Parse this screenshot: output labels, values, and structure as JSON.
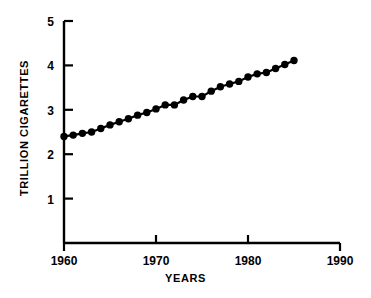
{
  "chart_data": {
    "type": "line",
    "title": "",
    "xlabel": "YEARS",
    "ylabel": "TRILLION CIGARETTES",
    "xlim": [
      1960,
      1990
    ],
    "ylim": [
      0,
      5
    ],
    "grid": false,
    "legend": null,
    "marker": "filled-circle",
    "line_color": "#000000",
    "marker_color": "#000000",
    "background_color": "#ffffff",
    "xticks": [
      1960,
      1970,
      1980,
      1990
    ],
    "xtick_labels": [
      "1960",
      "1970",
      "1980",
      "1990"
    ],
    "yticks": [
      1,
      2,
      3,
      4,
      5
    ],
    "ytick_labels": [
      "1",
      "2",
      "3",
      "4",
      "5"
    ],
    "x": [
      1960,
      1961,
      1962,
      1963,
      1964,
      1965,
      1966,
      1967,
      1968,
      1969,
      1970,
      1971,
      1972,
      1973,
      1974,
      1975,
      1976,
      1977,
      1978,
      1979,
      1980,
      1981,
      1982,
      1983,
      1984,
      1985
    ],
    "values": [
      2.4,
      2.42,
      2.46,
      2.5,
      2.58,
      2.65,
      2.72,
      2.8,
      2.88,
      2.93,
      3.0,
      3.1,
      3.1,
      3.2,
      3.28,
      3.28,
      3.4,
      3.5,
      3.56,
      3.62,
      3.72,
      3.78,
      3.8,
      3.88,
      3.95,
      4.0
    ],
    "values_full": [
      2.4,
      2.42,
      2.46,
      2.5,
      2.58,
      2.65,
      2.72,
      2.8,
      2.88,
      2.93,
      3.0,
      3.1,
      3.1,
      3.2,
      3.28,
      3.28,
      3.4,
      3.5,
      3.56,
      3.62,
      3.72,
      3.78,
      3.8,
      3.88,
      3.95,
      4.0
    ],
    "series": [
      {
        "name": "World cigarette consumption",
        "x": [
          1960,
          1961,
          1962,
          1963,
          1964,
          1965,
          1966,
          1967,
          1968,
          1969,
          1970,
          1971,
          1972,
          1973,
          1974,
          1975,
          1976,
          1977,
          1978,
          1979,
          1980,
          1981,
          1982,
          1983,
          1984,
          1985
        ],
        "y": [
          2.4,
          2.43,
          2.47,
          2.5,
          2.58,
          2.66,
          2.73,
          2.8,
          2.88,
          2.94,
          3.02,
          3.11,
          3.11,
          3.22,
          3.3,
          3.3,
          3.42,
          3.52,
          3.58,
          3.64,
          3.74,
          3.81,
          3.84,
          3.93,
          4.02,
          4.11
        ]
      }
    ],
    "points": [
      {
        "year": 1960,
        "value": 2.4
      },
      {
        "year": 1961,
        "value": 2.43
      },
      {
        "year": 1962,
        "value": 2.47
      },
      {
        "year": 1963,
        "value": 2.5
      },
      {
        "year": 1964,
        "value": 2.58
      },
      {
        "year": 1965,
        "value": 2.66
      },
      {
        "year": 1966,
        "value": 2.73
      },
      {
        "year": 1967,
        "value": 2.8
      },
      {
        "year": 1968,
        "value": 2.88
      },
      {
        "year": 1969,
        "value": 2.94
      },
      {
        "year": 1970,
        "value": 3.02
      },
      {
        "year": 1971,
        "value": 3.11
      },
      {
        "year": 1972,
        "value": 3.11
      },
      {
        "year": 1973,
        "value": 3.22
      },
      {
        "year": 1974,
        "value": 3.3
      },
      {
        "year": 1975,
        "value": 3.3
      },
      {
        "year": 1976,
        "value": 3.42
      },
      {
        "year": 1977,
        "value": 3.52
      },
      {
        "year": 1978,
        "value": 3.58
      },
      {
        "year": 1979,
        "value": 3.64
      },
      {
        "year": 1980,
        "value": 3.74
      },
      {
        "year": 1981,
        "value": 3.81
      },
      {
        "year": 1982,
        "value": 3.84
      },
      {
        "year": 1983,
        "value": 3.93
      },
      {
        "year": 1984,
        "value": 4.02
      },
      {
        "year": 1985,
        "value": 4.11
      },
      {
        "year": 1986,
        "value": 4.23
      },
      {
        "year": 1987,
        "value": 4.32
      },
      {
        "year": 1988,
        "value": 4.41
      },
      {
        "year": 1989,
        "value": 4.5
      },
      {
        "year": 1990,
        "value": 4.58
      }
    ]
  }
}
